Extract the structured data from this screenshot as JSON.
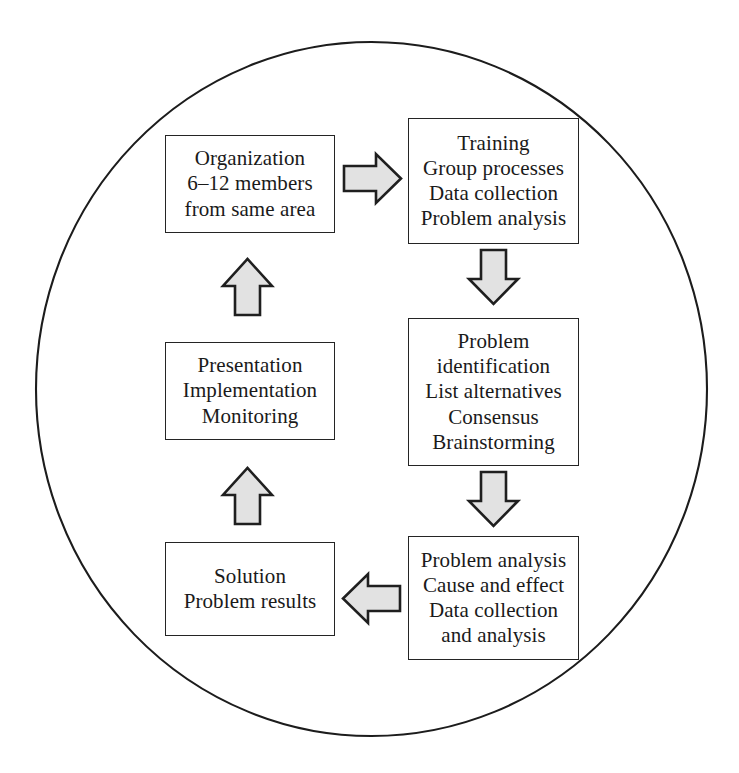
{
  "diagram": {
    "title": "Quality circle problem-solving cycle",
    "shape": "circle",
    "circle": {
      "center_x": 371,
      "center_y": 389,
      "radius": 336,
      "stroke": "#1c1c1c",
      "fill": "none"
    },
    "colors": {
      "box_border": "#242424",
      "box_fill": "#ffffff",
      "arrow_fill": "#e2e2e2",
      "arrow_stroke": "#1f1f1f",
      "text": "#1a1a1a",
      "background": "#ffffff"
    },
    "nodes": [
      {
        "id": "organization",
        "name": "Organization",
        "lines": [
          "Organization",
          "6–12 members",
          "from same area"
        ]
      },
      {
        "id": "training",
        "name": "Training",
        "lines": [
          "Training",
          "Group processes",
          "Data collection",
          "Problem analysis"
        ]
      },
      {
        "id": "problem-identification",
        "name": "Problem identification",
        "lines": [
          "Problem",
          "identification",
          "List alternatives",
          "Consensus",
          "Brainstorming"
        ]
      },
      {
        "id": "problem-analysis",
        "name": "Problem analysis",
        "lines": [
          "Problem analysis",
          "Cause and effect",
          "Data collection",
          "and analysis"
        ]
      },
      {
        "id": "solution",
        "name": "Solution",
        "lines": [
          "Solution",
          "Problem results"
        ]
      },
      {
        "id": "presentation",
        "name": "Presentation",
        "lines": [
          "Presentation",
          "Implementation",
          "Monitoring"
        ]
      }
    ],
    "arrows": [
      {
        "id": "organization-to-training",
        "direction": "right",
        "from": "organization",
        "to": "training"
      },
      {
        "id": "training-to-problem-identification",
        "direction": "down",
        "from": "training",
        "to": "problem-identification"
      },
      {
        "id": "problem-identification-to-problem-analysis",
        "direction": "down",
        "from": "problem-identification",
        "to": "problem-analysis"
      },
      {
        "id": "problem-analysis-to-solution",
        "direction": "left",
        "from": "problem-analysis",
        "to": "solution"
      },
      {
        "id": "solution-to-presentation",
        "direction": "up",
        "from": "solution",
        "to": "presentation"
      },
      {
        "id": "presentation-to-organization",
        "direction": "up",
        "from": "presentation",
        "to": "organization"
      }
    ]
  }
}
